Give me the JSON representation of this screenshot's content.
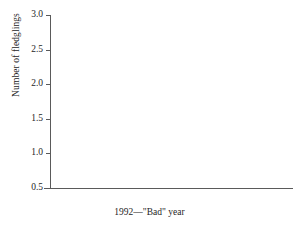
{
  "chart_data": {
    "type": "bar",
    "title": "",
    "subtitle": "",
    "xlabel": "1992—\"Bad\" year",
    "ylabel": "Number of fledglings",
    "categories": [
      "Full clutch",
      "Reduced clutch"
    ],
    "series": [
      {
        "name": "dark",
        "color": "#131313",
        "values": [
          0.75,
          1.33
        ]
      },
      {
        "name": "light",
        "color": "#eaeaea",
        "values": [
          0.93,
          1.9
        ]
      }
    ],
    "ylim": [
      0.5,
      3.0
    ],
    "ytick_labels": [
      "0.5",
      "1.0",
      "1.5",
      "2.0",
      "2.5",
      "3.0"
    ],
    "ytick_values": [
      0.5,
      1.0,
      1.5,
      2.0,
      2.5,
      3.0
    ],
    "grid": false,
    "legend": "none",
    "annotations": []
  },
  "axes": {
    "y_title": "Number of fledglings",
    "x_title": "1992—\"Bad\" year",
    "ticks": [
      {
        "label": "3.0",
        "value": 3.0
      },
      {
        "label": "2.5",
        "value": 2.5
      },
      {
        "label": "2.0",
        "value": 2.0
      },
      {
        "label": "1.5",
        "value": 1.5
      },
      {
        "label": "1.0",
        "value": 1.0
      },
      {
        "label": "0.5",
        "value": 0.5
      }
    ]
  },
  "categories": [
    {
      "label": "Full clutch"
    },
    {
      "label": "Reduced clutch"
    }
  ],
  "colors": {
    "dark_bar": "#131313",
    "light_bar": "#eaeaea",
    "light_bar_border": "#858585",
    "axis": "#5a5a5a",
    "text": "#262626",
    "background": "#ffffff"
  }
}
